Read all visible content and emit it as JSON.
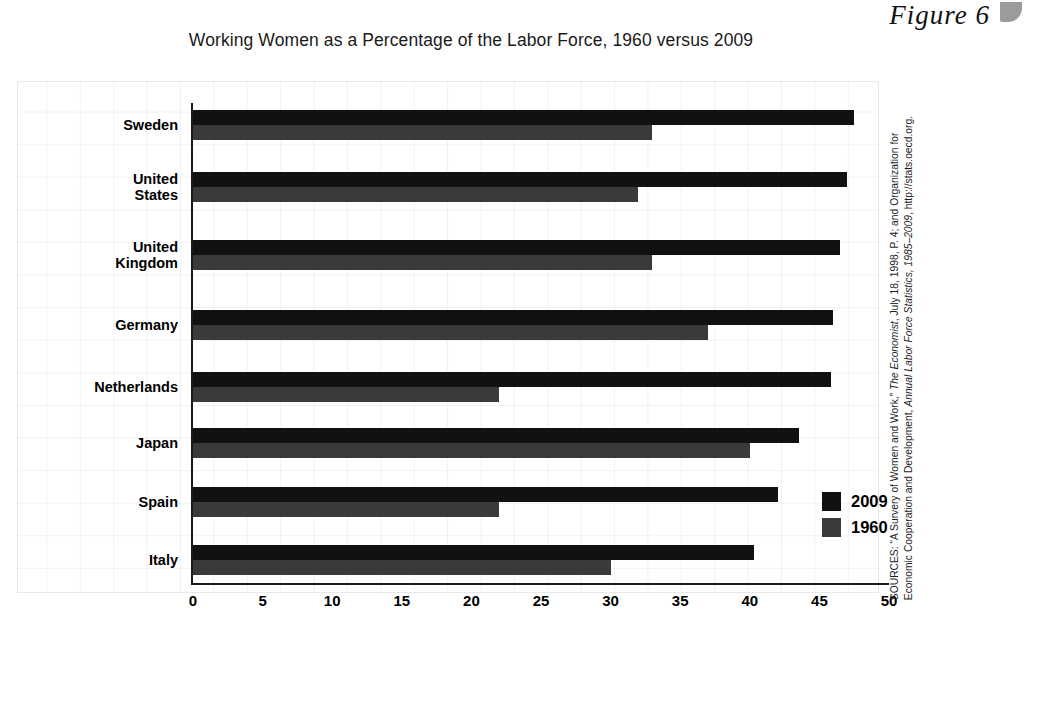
{
  "figure": {
    "label": "Figure 6",
    "tab_icon": "page-tab-icon"
  },
  "chart_title": "Working Women as a Percentage of the Labor Force, 1960 versus 2009",
  "source": {
    "prefix": "SOURCES: “A Survery of Women and Work,” ",
    "italic1": "The Economist",
    "mid": ", July 18, 1998, P. 4; and Organization for Economic Cooperation and Development, ",
    "italic2": "Annual Labor Force Statistics, 1985–2009",
    "suffix": ", http://stats.oecd.org."
  },
  "legend": {
    "position": "inside-bottom-right",
    "entries": [
      {
        "label": "2009",
        "color": "#111111"
      },
      {
        "label": "1960",
        "color": "#3a3a3a"
      }
    ]
  },
  "axis": {
    "ticks": [
      "0",
      "5",
      "10",
      "15",
      "20",
      "25",
      "30",
      "35",
      "40",
      "45",
      "50"
    ],
    "xlabel": "",
    "ylabel": ""
  },
  "chart_data": {
    "type": "bar",
    "orientation": "horizontal",
    "title": "Working Women as a Percentage of the Labor Force, 1960 versus 2009",
    "xlabel": "",
    "ylabel": "",
    "xlim": [
      0,
      50
    ],
    "xticks": [
      0,
      5,
      10,
      15,
      20,
      25,
      30,
      35,
      40,
      45,
      50
    ],
    "grid": true,
    "legend_position": "inside-bottom-right",
    "categories": [
      "Sweden",
      "United\nStates",
      "United\nKingdom",
      "Germany",
      "Netherlands",
      "Japan",
      "Spain",
      "Italy"
    ],
    "series": [
      {
        "name": "2009",
        "color": "#111111",
        "values": [
          47.5,
          47.0,
          46.5,
          46.0,
          45.8,
          43.5,
          42.0,
          40.3
        ]
      },
      {
        "name": "1960",
        "color": "#3a3a3a",
        "values": [
          33.0,
          32.0,
          33.0,
          37.0,
          22.0,
          40.0,
          22.0,
          30.0
        ]
      }
    ]
  },
  "rows": [
    {
      "name": "Sweden",
      "line1": "Sweden",
      "line2": "",
      "v2009": 47.5,
      "v1960": 33.0,
      "top": 110
    },
    {
      "name": "United States",
      "line1": "United",
      "line2": "States",
      "v2009": 47.0,
      "v1960": 32.0,
      "top": 172
    },
    {
      "name": "United Kingdom",
      "line1": "United",
      "line2": "Kingdom",
      "v2009": 46.5,
      "v1960": 33.0,
      "top": 240
    },
    {
      "name": "Germany",
      "line1": "Germany",
      "line2": "",
      "v2009": 46.0,
      "v1960": 37.0,
      "top": 310
    },
    {
      "name": "Netherlands",
      "line1": "Netherlands",
      "line2": "",
      "v2009": 45.8,
      "v1960": 22.0,
      "top": 372
    },
    {
      "name": "Japan",
      "line1": "Japan",
      "line2": "",
      "v2009": 43.5,
      "v1960": 40.0,
      "top": 428
    },
    {
      "name": "Spain",
      "line1": "Spain",
      "line2": "",
      "v2009": 42.0,
      "v1960": 22.0,
      "top": 487
    },
    {
      "name": "Italy",
      "line1": "Italy",
      "line2": "",
      "v2009": 40.3,
      "v1960": 30.0,
      "top": 545
    }
  ]
}
